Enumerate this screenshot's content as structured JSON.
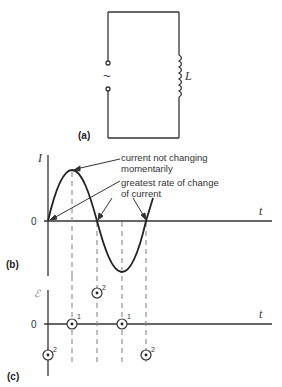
{
  "panel_a": {
    "label": "(a)",
    "source_symbol": "~",
    "inductor_label": "L"
  },
  "panel_b": {
    "label": "(b)",
    "y_axis_label": "I",
    "x_axis_label": "t",
    "origin_label": "0",
    "annotation_peak_line1": "current not changing",
    "annotation_peak_line2": "momentarily",
    "annotation_zero_line1": "greatest rate of change",
    "annotation_zero_line2": "of current"
  },
  "panel_c": {
    "label": "(c)",
    "y_axis_label": "ℰ",
    "x_axis_label": "t",
    "origin_label": "0",
    "markers": [
      {
        "x_index": 0,
        "level": "negative",
        "tag": "2"
      },
      {
        "x_index": 1,
        "level": "zero",
        "tag": "1"
      },
      {
        "x_index": 2,
        "level": "positive",
        "tag": "2"
      },
      {
        "x_index": 3,
        "level": "zero",
        "tag": "1"
      },
      {
        "x_index": 4,
        "level": "negative",
        "tag": "2"
      }
    ]
  },
  "colors": {
    "line": "#333333",
    "dash": "#888888",
    "background": "#ffffff"
  }
}
